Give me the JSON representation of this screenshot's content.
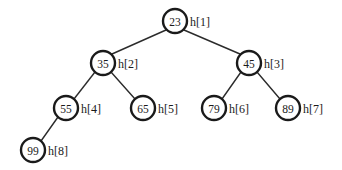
{
  "figure": {
    "kind": "binary-tree-diagram",
    "background_color": "#ffffff",
    "stroke_color": "#1a1a1a",
    "edge_color": "#2b2b2b",
    "node_fill": "#ffffff",
    "node_radius": 12,
    "width": 342,
    "height": 170
  },
  "nodes": [
    {
      "id": "n1",
      "value": "23",
      "label": "h[1]",
      "cx": 175,
      "cy": 21,
      "label_x": 190,
      "label_y": 21
    },
    {
      "id": "n2",
      "value": "35",
      "label": "h[2]",
      "cx": 103,
      "cy": 63,
      "label_x": 118,
      "label_y": 63
    },
    {
      "id": "n3",
      "value": "45",
      "label": "h[3]",
      "cx": 249,
      "cy": 63,
      "label_x": 264,
      "label_y": 63
    },
    {
      "id": "n4",
      "value": "55",
      "label": "h[4]",
      "cx": 66,
      "cy": 108,
      "label_x": 81,
      "label_y": 108
    },
    {
      "id": "n5",
      "value": "65",
      "label": "h[5]",
      "cx": 143,
      "cy": 108,
      "label_x": 158,
      "label_y": 108
    },
    {
      "id": "n6",
      "value": "79",
      "label": "h[6]",
      "cx": 214,
      "cy": 108,
      "label_x": 229,
      "label_y": 108
    },
    {
      "id": "n7",
      "value": "89",
      "label": "h[7]",
      "cx": 288,
      "cy": 108,
      "label_x": 303,
      "label_y": 108
    },
    {
      "id": "n8",
      "value": "99",
      "label": "h[8]",
      "cx": 33,
      "cy": 150,
      "label_x": 48,
      "label_y": 150
    }
  ],
  "edges": [
    {
      "id": "e1",
      "from": "n1",
      "to": "n2",
      "x1": 166,
      "y1": 30,
      "x2": 112,
      "y2": 54
    },
    {
      "id": "e2",
      "from": "n1",
      "to": "n3",
      "x1": 184,
      "y1": 30,
      "x2": 240,
      "y2": 54
    },
    {
      "id": "e3",
      "from": "n2",
      "to": "n4",
      "x1": 95,
      "y1": 72,
      "x2": 74,
      "y2": 99
    },
    {
      "id": "e4",
      "from": "n2",
      "to": "n5",
      "x1": 111,
      "y1": 72,
      "x2": 135,
      "y2": 99
    },
    {
      "id": "e5",
      "from": "n3",
      "to": "n6",
      "x1": 241,
      "y1": 72,
      "x2": 222,
      "y2": 99
    },
    {
      "id": "e6",
      "from": "n3",
      "to": "n7",
      "x1": 257,
      "y1": 72,
      "x2": 280,
      "y2": 99
    },
    {
      "id": "e7",
      "from": "n4",
      "to": "n8",
      "x1": 58,
      "y1": 117,
      "x2": 41,
      "y2": 141
    }
  ]
}
